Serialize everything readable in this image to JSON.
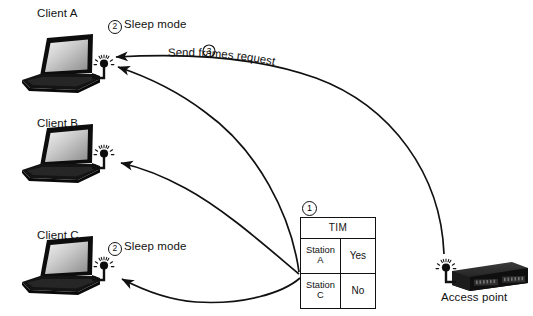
{
  "diagram": {
    "background": "#ffffff",
    "ink": "#111111"
  },
  "clients": [
    {
      "id": "client-a",
      "label": "Client A",
      "state_num": "2",
      "state_label": "Sleep mode",
      "has_state_label": true,
      "icon": "laptop-icon",
      "antenna": "antenna-signal-icon"
    },
    {
      "id": "client-b",
      "label": "Client B",
      "state_num": "",
      "state_label": "",
      "has_state_label": false,
      "icon": "laptop-icon",
      "antenna": "antenna-signal-icon"
    },
    {
      "id": "client-c",
      "label": "Client C",
      "state_num": "2",
      "state_label": "Sleep mode",
      "has_state_label": true,
      "icon": "laptop-icon",
      "antenna": "antenna-signal-icon"
    }
  ],
  "tim": {
    "step_num": "1",
    "header": "TIM",
    "columns": [
      "Station",
      "Buffered"
    ],
    "rows": [
      {
        "station_line1": "Station",
        "station_line2": "A",
        "value": "Yes"
      },
      {
        "station_line1": "Station",
        "station_line2": "C",
        "value": "No"
      }
    ]
  },
  "access_point": {
    "label": "Access point",
    "icon": "access-point-icon",
    "antenna": "antenna-signal-icon"
  },
  "flows": [
    {
      "id": "flow-send-frames",
      "num": "3",
      "label": "Send frames request",
      "from": "access-point",
      "to": "client-a"
    },
    {
      "id": "flow-tim-to-a",
      "label": "",
      "from": "tim-table",
      "to": "client-a"
    },
    {
      "id": "flow-tim-to-b",
      "label": "",
      "from": "tim-table",
      "to": "client-b"
    },
    {
      "id": "flow-tim-to-c",
      "label": "",
      "from": "tim-table",
      "to": "client-c"
    }
  ]
}
